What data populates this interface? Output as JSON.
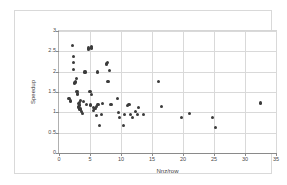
{
  "chart_data": {
    "type": "scatter",
    "title": "",
    "xlabel": "Nnz/row",
    "ylabel": "Speedup",
    "xlim": [
      0,
      35
    ],
    "ylim": [
      0,
      3
    ],
    "xticks": [
      "0",
      "5",
      "10",
      "15",
      "20",
      "25",
      "30",
      "35"
    ],
    "xtick_values": [
      0,
      5,
      10,
      15,
      20,
      25,
      30,
      35
    ],
    "yticks": [
      "0",
      "0.5",
      "1",
      "1.5",
      "2",
      "2.5",
      "3"
    ],
    "ytick_values": [
      0,
      0.5,
      1,
      1.5,
      2,
      2.5,
      3
    ],
    "grid": true,
    "legend": false,
    "marker_color": "#3b3b3b",
    "marker_shape": "circle",
    "series": [
      {
        "name": "matrices",
        "points": [
          [
            1.6,
            1.35
          ],
          [
            1.9,
            1.28
          ],
          [
            2.2,
            2.65
          ],
          [
            2.3,
            2.38
          ],
          [
            2.3,
            2.22
          ],
          [
            2.35,
            2.05
          ],
          [
            2.5,
            1.72
          ],
          [
            2.6,
            1.75
          ],
          [
            2.7,
            1.73
          ],
          [
            2.8,
            1.84
          ],
          [
            2.9,
            1.52
          ],
          [
            3.0,
            1.45
          ],
          [
            3.1,
            1.22
          ],
          [
            3.15,
            1.15
          ],
          [
            3.2,
            1.12
          ],
          [
            3.25,
            1.18
          ],
          [
            3.3,
            1.24
          ],
          [
            3.4,
            1.08
          ],
          [
            3.5,
            1.3
          ],
          [
            3.6,
            1.02
          ],
          [
            3.8,
            0.98
          ],
          [
            4.0,
            1.27
          ],
          [
            4.2,
            1.99
          ],
          [
            4.5,
            1.2
          ],
          [
            4.7,
            2.55
          ],
          [
            4.8,
            2.58
          ],
          [
            5.0,
            1.52
          ],
          [
            5.1,
            1.18
          ],
          [
            5.2,
            2.62
          ],
          [
            5.25,
            2.58
          ],
          [
            5.3,
            1.43
          ],
          [
            5.5,
            1.05
          ],
          [
            5.6,
            1.12
          ],
          [
            5.8,
            1.1
          ],
          [
            6.0,
            1.15
          ],
          [
            6.1,
            0.93
          ],
          [
            6.2,
            1.99
          ],
          [
            6.3,
            1.2
          ],
          [
            6.5,
            0.68
          ],
          [
            6.8,
            0.95
          ],
          [
            7.0,
            1.22
          ],
          [
            7.6,
            2.2
          ],
          [
            7.7,
            2.17
          ],
          [
            7.8,
            2.22
          ],
          [
            7.9,
            1.75
          ],
          [
            8.1,
            2.03
          ],
          [
            8.4,
            1.2
          ],
          [
            9.4,
            1.35
          ],
          [
            9.6,
            1.0
          ],
          [
            9.7,
            0.87
          ],
          [
            10.4,
            0.68
          ],
          [
            10.6,
            0.95
          ],
          [
            11.0,
            1.17
          ],
          [
            11.3,
            1.2
          ],
          [
            11.5,
            0.95
          ],
          [
            11.8,
            0.87
          ],
          [
            12.3,
            1.02
          ],
          [
            12.6,
            0.95
          ],
          [
            12.8,
            1.12
          ],
          [
            13.6,
            0.94
          ],
          [
            16.0,
            1.75
          ],
          [
            16.5,
            1.14
          ],
          [
            19.7,
            0.88
          ],
          [
            21.1,
            0.97
          ],
          [
            24.8,
            0.88
          ],
          [
            25.3,
            0.63
          ],
          [
            32.5,
            1.23
          ]
        ]
      }
    ]
  }
}
